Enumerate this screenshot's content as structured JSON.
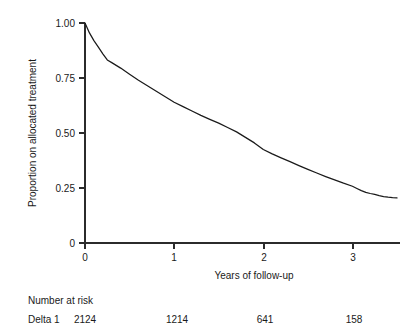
{
  "chart_data": {
    "type": "line",
    "title": "",
    "xlabel": "Years of follow-up",
    "ylabel": "Proportion on allocated treatment",
    "xlim": [
      0,
      3.5
    ],
    "ylim": [
      0,
      1.0
    ],
    "grid": false,
    "legend": "none",
    "x_ticks": [
      0,
      1,
      2,
      3
    ],
    "x_tick_labels": [
      "0",
      "1",
      "2",
      "3"
    ],
    "y_ticks": [
      0,
      0.25,
      0.5,
      0.75,
      1.0
    ],
    "y_tick_labels": [
      "0",
      "0.25",
      "0.50",
      "0.75",
      "1.00"
    ],
    "series": [
      {
        "name": "Delta 1",
        "x": [
          0.0,
          0.05,
          0.1,
          0.15,
          0.2,
          0.25,
          0.3,
          0.4,
          0.5,
          0.6,
          0.7,
          0.8,
          0.9,
          1.0,
          1.1,
          1.2,
          1.3,
          1.4,
          1.5,
          1.6,
          1.7,
          1.8,
          1.9,
          2.0,
          2.1,
          2.2,
          2.3,
          2.4,
          2.5,
          2.6,
          2.7,
          2.8,
          2.9,
          3.0,
          3.05,
          3.1,
          3.15,
          3.2,
          3.25,
          3.3,
          3.35,
          3.4,
          3.45,
          3.5
        ],
        "values": [
          1.0,
          0.955,
          0.92,
          0.89,
          0.86,
          0.832,
          0.82,
          0.795,
          0.767,
          0.74,
          0.715,
          0.69,
          0.665,
          0.64,
          0.62,
          0.6,
          0.58,
          0.562,
          0.545,
          0.525,
          0.505,
          0.48,
          0.455,
          0.425,
          0.405,
          0.387,
          0.37,
          0.352,
          0.335,
          0.318,
          0.302,
          0.287,
          0.272,
          0.258,
          0.248,
          0.238,
          0.23,
          0.225,
          0.221,
          0.215,
          0.211,
          0.208,
          0.206,
          0.205
        ]
      }
    ],
    "annotations": []
  },
  "axes": {
    "y_labels": [
      "1.00",
      "0.75",
      "0.50",
      "0.25",
      "0"
    ],
    "x_labels": [
      "0",
      "1",
      "2",
      "3"
    ],
    "x_title": "Years of follow-up",
    "y_title": "Proportion on allocated treatment"
  },
  "risk_table": {
    "heading": "Number at risk",
    "rows": [
      {
        "label": "Delta 1",
        "counts": [
          "2124",
          "1214",
          "641",
          "158"
        ]
      }
    ]
  }
}
